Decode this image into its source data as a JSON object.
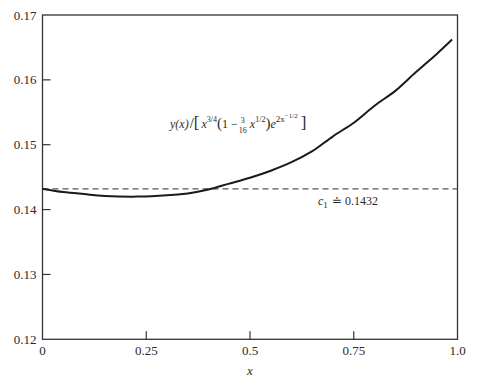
{
  "chart_data": {
    "type": "line",
    "title": "",
    "xlabel": "x",
    "ylabel": "",
    "xlim": [
      0,
      1.0
    ],
    "ylim": [
      0.12,
      0.17
    ],
    "grid": false,
    "legend": null,
    "x_ticks": [
      "0",
      "0.25",
      "0.5",
      "0.75",
      "1.0"
    ],
    "x_tick_values": [
      0,
      0.25,
      0.5,
      0.75,
      1.0
    ],
    "y_ticks": [
      "0.12",
      "0.13",
      "0.14",
      "0.15",
      "0.16",
      "0.17"
    ],
    "y_tick_values": [
      0.12,
      0.13,
      0.14,
      0.15,
      0.16,
      0.17
    ],
    "series": [
      {
        "name": "y(x)/[x^{3/4}(1 − (3/16) x^{1/2}) e^{2x^{−1/2}}]",
        "style": "solid",
        "color": "#1a1a1a",
        "x": [
          0,
          0.05,
          0.1,
          0.15,
          0.23,
          0.3,
          0.35,
          0.4,
          0.45,
          0.5,
          0.55,
          0.6,
          0.65,
          0.7,
          0.75,
          0.8,
          0.85,
          0.9,
          0.95,
          0.987
        ],
        "values": [
          0.1432,
          0.1427,
          0.1424,
          0.1421,
          0.142,
          0.1422,
          0.1425,
          0.1431,
          0.144,
          0.1449,
          0.146,
          0.1473,
          0.149,
          0.1513,
          0.1534,
          0.156,
          0.1583,
          0.1612,
          0.164,
          0.1662
        ]
      },
      {
        "name": "c1 ≐ 0.1432",
        "style": "dashed",
        "color": "#555555",
        "x": [
          0,
          1.0
        ],
        "values": [
          0.1432,
          0.1432
        ]
      }
    ],
    "annotations": [
      {
        "id": "curve_label",
        "parts": {
          "lhs": "y(x)",
          "slash": "/",
          "lbr": "[",
          "x1": "x",
          "x1_exp": "3/4",
          "lparen": "(",
          "one_minus": "1 − ",
          "frac_num": "3",
          "frac_den": "16",
          "x2": "x",
          "x2_exp": "1/2",
          "rparen": ")",
          "e": "e",
          "e_exp": "2x",
          "e_exp_exp": "−1/2",
          "rbr": "]"
        },
        "x": 0.31,
        "y": 0.1477
      },
      {
        "id": "c1_label",
        "symbol": "c",
        "subscript": "1",
        "relation": "≐",
        "value": "0.1432",
        "x": 0.64,
        "y": 0.1418
      }
    ]
  }
}
